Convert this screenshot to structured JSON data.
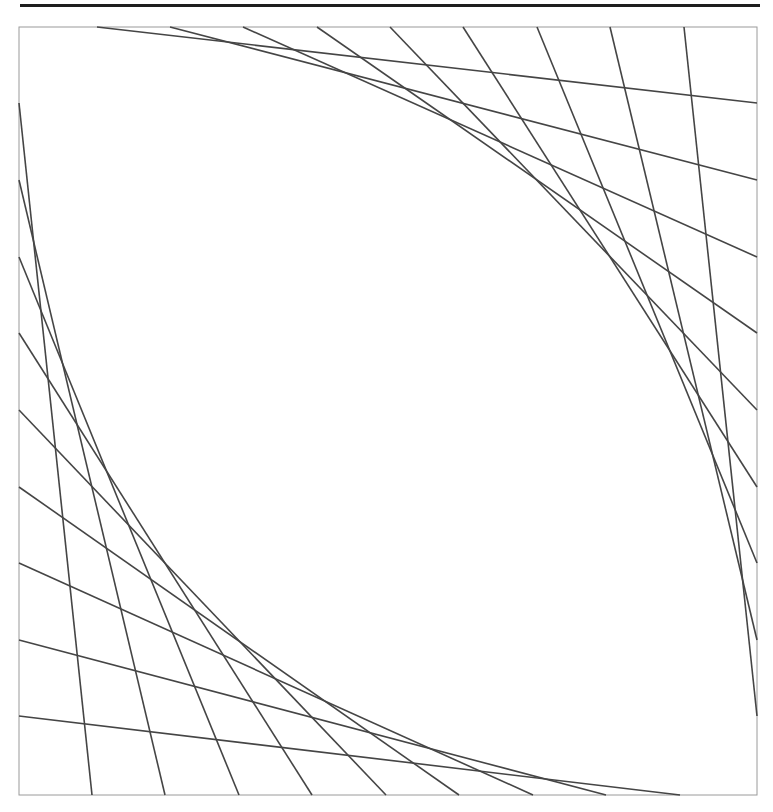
{
  "figure": {
    "type": "string-art-envelope",
    "colors": {
      "rule": "#1e1e1e",
      "frame": "#9a9a9a",
      "stroke": "#454545",
      "background": "#ffffff"
    },
    "frame": {
      "x": 19,
      "y": 27,
      "width": 738,
      "height": 768
    },
    "stroke_width": 1.6,
    "top_edge_x": [
      97,
      170,
      243,
      317,
      390,
      463,
      537,
      610,
      684
    ],
    "right_edge_y": [
      103,
      180,
      257,
      333,
      410,
      487,
      563,
      640,
      716
    ],
    "left_edge_y": [
      103,
      180,
      257,
      333,
      410,
      487,
      563,
      640,
      716
    ],
    "bottom_edge_x": [
      92,
      165,
      239,
      312,
      386,
      459,
      533,
      606,
      680
    ]
  }
}
